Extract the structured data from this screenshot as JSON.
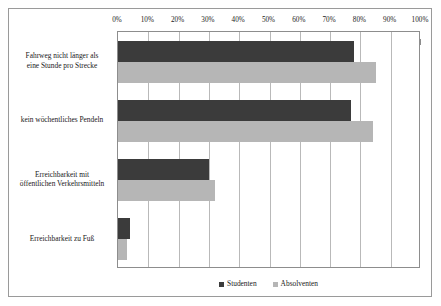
{
  "chart_data": {
    "type": "bar",
    "orientation": "horizontal",
    "title": "",
    "xlabel": "",
    "ylabel": "",
    "xlim": [
      0,
      100
    ],
    "xtick_labels": [
      "0%",
      "10%",
      "20%",
      "30%",
      "40%",
      "50%",
      "60%",
      "70%",
      "80%",
      "90%",
      "100%"
    ],
    "xticks": [
      0,
      10,
      20,
      30,
      40,
      50,
      60,
      70,
      80,
      90,
      100
    ],
    "grid": true,
    "legend_position": "bottom",
    "categories": [
      "Fahrweg nicht länger als eine Stunde pro Strecke",
      "kein wöchentliches Pendeln",
      "Erreichbarkeit mit öffentlichen Verkehrsmitteln",
      "Erreichbarkeit zu Fuß"
    ],
    "category_lines": [
      [
        "Fahrweg nicht länger als",
        "eine Stunde pro Strecke"
      ],
      [
        "kein wöchentliches Pendeln"
      ],
      [
        "Erreichbarkeit mit",
        "öffentlichen Verkehrsmitteln"
      ],
      [
        "Erreichbarkeit zu Fuß"
      ]
    ],
    "series": [
      {
        "name": "Studenten",
        "color": "#3b3b3b",
        "values": [
          78,
          77,
          30,
          4
        ]
      },
      {
        "name": "Absolventen",
        "color": "#b6b6b6",
        "values": [
          85,
          84,
          32,
          3
        ]
      }
    ]
  },
  "legend": {
    "items": [
      {
        "label": "Studenten",
        "color": "#3b3b3b"
      },
      {
        "label": "Absolventen",
        "color": "#b6b6b6"
      }
    ]
  },
  "colors": {
    "studenten": "#3b3b3b",
    "absolventen": "#b6b6b6",
    "gridline": "#b9b9b9",
    "axis": "#8d8d8d",
    "frame": "#9a9a9a",
    "text": "#1a1a1a",
    "background": "#ffffff"
  }
}
